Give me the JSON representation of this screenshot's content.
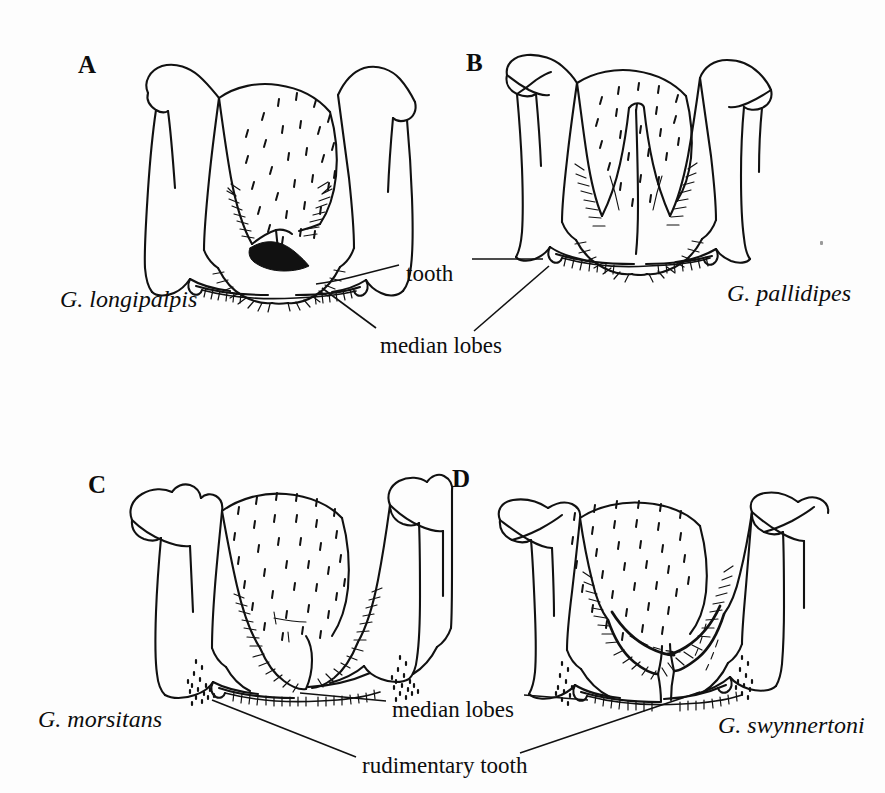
{
  "figure": {
    "kind": "scientific-line-drawing-plate",
    "background_color": "#fdfdfd",
    "ink_color": "#111111",
    "panel_count": 4
  },
  "panels": [
    {
      "letter": "A",
      "species": "G. longipalpis",
      "letter_pos": {
        "x": 78,
        "y": 52
      },
      "species_pos": {
        "x": 60,
        "y": 287
      }
    },
    {
      "letter": "B",
      "species": "G. pallidipes",
      "letter_pos": {
        "x": 466,
        "y": 50
      },
      "species_pos": {
        "x": 727,
        "y": 281
      }
    },
    {
      "letter": "C",
      "species": "G. morsitans",
      "letter_pos": {
        "x": 88,
        "y": 472
      },
      "species_pos": {
        "x": 38,
        "y": 707
      }
    },
    {
      "letter": "D",
      "species": "G. swynnertoni",
      "letter_pos": {
        "x": 452,
        "y": 466
      },
      "species_pos": {
        "x": 718,
        "y": 713
      }
    }
  ],
  "callouts": [
    {
      "id": "tooth",
      "text": "tooth",
      "pos": {
        "x": 406,
        "y": 262
      },
      "serves_panels": [
        "A",
        "B"
      ]
    },
    {
      "id": "median-lobes-top",
      "text": "median lobes",
      "pos": {
        "x": 380,
        "y": 334
      },
      "serves_panels": [
        "A",
        "B"
      ]
    },
    {
      "id": "median-lobes-bottom",
      "text": "median lobes",
      "pos": {
        "x": 392,
        "y": 698
      },
      "serves_panels": [
        "C",
        "D"
      ]
    },
    {
      "id": "rudimentary-tooth",
      "text": "rudimentary tooth",
      "pos": {
        "x": 362,
        "y": 754
      },
      "serves_panels": [
        "C",
        "D"
      ]
    }
  ],
  "artifacts": [
    {
      "id": "dust-speck",
      "x": 820,
      "y": 241
    }
  ]
}
